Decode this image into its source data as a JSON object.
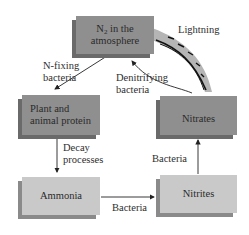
{
  "diagram": {
    "nodes": {
      "n2": {
        "prefix": "N",
        "sub": "2",
        "suffix": " in the",
        "line2": "atmosphere"
      },
      "plant": {
        "line1": "Plant and",
        "line2": "animal protein"
      },
      "nitrates": {
        "label": "Nitrates"
      },
      "ammonia": {
        "label": "Ammonia"
      },
      "nitrites": {
        "label": "Nitrites"
      }
    },
    "edges": {
      "n_fixing": {
        "line1": "N-fixing",
        "line2": "bacteria"
      },
      "lightning": {
        "label": "Lightning"
      },
      "denitrifying": {
        "line1": "Denitrifying",
        "line2": "bacteria"
      },
      "decay": {
        "line1": "Decay",
        "line2": "processes"
      },
      "ammonia_to_nitrites": {
        "label": "Bacteria"
      },
      "nitrites_to_nitrates": {
        "label": "Bacteria"
      }
    },
    "colors": {
      "dark_box": "#8f8f8f",
      "light_box": "#c9c9c9",
      "arrow": "#222222",
      "lightning_band": "#b5b5b5"
    }
  }
}
